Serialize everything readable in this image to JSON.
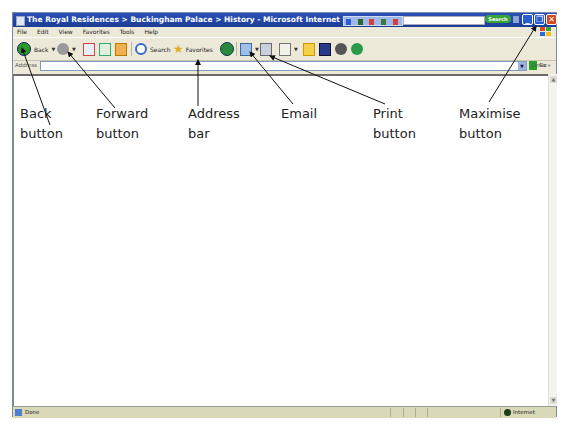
{
  "window": {
    "title": "The Royal Residences > Buckingham Palace > History - Microsoft Internet Explorer",
    "search_button": "Search"
  },
  "menu": [
    "File",
    "Edit",
    "View",
    "Favorites",
    "Tools",
    "Help"
  ],
  "toolbar": {
    "back": "Back",
    "search": "Search",
    "favorites": "Favorites"
  },
  "address": {
    "label": "Address",
    "value": "",
    "go": "Go",
    "links": "Links"
  },
  "status": {
    "text": "Done",
    "zone": "Internet"
  },
  "annotations": [
    {
      "label": "Back\nbutton"
    },
    {
      "label": "Forward\nbutton"
    },
    {
      "label": "Address\nbar"
    },
    {
      "label": "Email"
    },
    {
      "label": "Print\nbutton"
    },
    {
      "label": "Maximise\nbutton"
    }
  ]
}
